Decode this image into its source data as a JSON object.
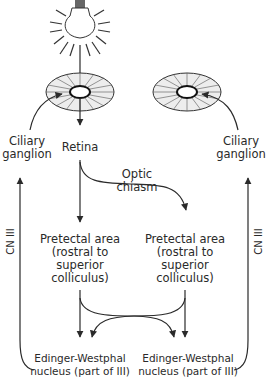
{
  "diagram": {
    "type": "pupillary-light-reflex-pathway",
    "nodes": {
      "light_source": "light-bulb",
      "retina_left": {
        "label": "Retina"
      },
      "ciliary_left": {
        "line1": "Ciliary",
        "line2": "ganglion"
      },
      "ciliary_right": {
        "line1": "Ciliary",
        "line2": "ganglion"
      },
      "chiasm": {
        "line1": "Optic",
        "line2": "chiasm"
      },
      "pretectal_left": {
        "line1": "Pretectal area",
        "line2": "(rostral to",
        "line3": "superior",
        "line4": "colliculus)"
      },
      "pretectal_right": {
        "line1": "Pretectal area",
        "line2": "(rostral to",
        "line3": "superior",
        "line4": "colliculus)"
      },
      "ew_left": {
        "line1": "Edinger-Westphal",
        "line2": "nucleus (part of III)"
      },
      "ew_right": {
        "line1": "Edinger-Westphal",
        "line2": "nucleus (part of III)"
      },
      "cn_left": {
        "label": "CN III"
      },
      "cn_right": {
        "label": "CN III"
      }
    },
    "edges": [
      {
        "from": "light_source",
        "to": "retina_left"
      },
      {
        "from": "retina_left",
        "to": "pretectal_left"
      },
      {
        "from": "retina_left",
        "to": "pretectal_right",
        "via": "chiasm"
      },
      {
        "from": "pretectal_left",
        "to": "ew_left"
      },
      {
        "from": "pretectal_left",
        "to": "ew_right"
      },
      {
        "from": "pretectal_right",
        "to": "ew_right"
      },
      {
        "from": "pretectal_right",
        "to": "ew_left"
      },
      {
        "from": "ew_left",
        "to": "ciliary_left",
        "label": "CN III"
      },
      {
        "from": "ew_right",
        "to": "ciliary_right",
        "label": "CN III"
      },
      {
        "from": "ciliary_left",
        "to": "eye_left"
      },
      {
        "from": "ciliary_right",
        "to": "eye_right"
      }
    ],
    "colors": {
      "stroke": "#2a2a2a",
      "background": "#ffffff"
    }
  }
}
